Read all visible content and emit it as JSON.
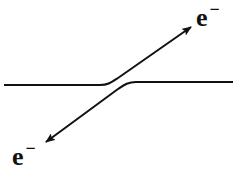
{
  "diagram": {
    "type": "electron-scattering-schematic",
    "colors": {
      "stroke": "#111111",
      "background": "#ffffff"
    },
    "labels": {
      "top_right": {
        "base": "e",
        "sup": "−"
      },
      "bottom_left": {
        "base": "e",
        "sup": "−"
      }
    },
    "paths": [
      {
        "id": "incoming-left-to-upper-right",
        "description": "horizontal line from left curving up to arrow pointing upper right"
      },
      {
        "id": "incoming-right-to-lower-left",
        "description": "horizontal line from right curving down to arrow pointing lower left"
      }
    ]
  }
}
